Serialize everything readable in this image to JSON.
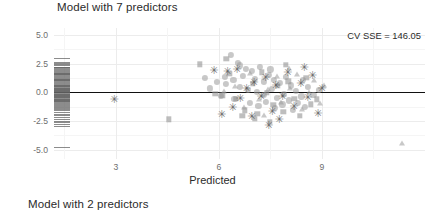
{
  "panels": {
    "top_title": "Model with 7 predictors",
    "bottom_title": "Model with 2 predictors"
  },
  "annotation": "CV SSE = 146.05",
  "chart_data": {
    "type": "scatter",
    "title": "Model with 7 predictors",
    "xlabel": "Predicted",
    "ylabel": "Prediction error\n(residual)",
    "xlim": [
      1.2,
      12.0
    ],
    "ylim": [
      -5.8,
      5.6
    ],
    "xticks": [
      "3",
      "6",
      "9"
    ],
    "xtick_values": [
      3,
      6,
      9
    ],
    "yticks": [
      "5.0",
      "2.5",
      "0.0",
      "-2.5",
      "-5.0"
    ],
    "ytick_values": [
      5.0,
      2.5,
      0.0,
      -2.5,
      -5.0
    ],
    "grid": true,
    "legend": "none",
    "annotations": [
      {
        "text": "CV SSE = 146.05",
        "x": 9.6,
        "y": 4.3
      }
    ],
    "reference_line": {
      "y": 0,
      "color": "#111111"
    },
    "marker_color": "#8f8f8f",
    "series": [
      {
        "name": "circle",
        "marker": "circle",
        "points": [
          [
            6.35,
            3.25
          ],
          [
            6.55,
            2.55
          ],
          [
            6.62,
            2.35
          ],
          [
            6.78,
            2.05
          ],
          [
            6.95,
            1.85
          ],
          [
            6.18,
            1.35
          ],
          [
            6.42,
            1.1
          ],
          [
            6.7,
            1.45
          ],
          [
            7.05,
            1.2
          ],
          [
            7.3,
            0.95
          ],
          [
            7.45,
            1.55
          ],
          [
            7.6,
            1.1
          ],
          [
            7.78,
            0.8
          ],
          [
            7.95,
            1.35
          ],
          [
            8.1,
            0.6
          ],
          [
            6.6,
            0.45
          ],
          [
            6.85,
            0.2
          ],
          [
            7.1,
            0.05
          ],
          [
            7.32,
            -0.2
          ],
          [
            7.55,
            0.3
          ],
          [
            7.7,
            -0.45
          ],
          [
            7.9,
            -0.1
          ],
          [
            8.05,
            -0.7
          ],
          [
            8.25,
            0.15
          ],
          [
            8.4,
            -0.35
          ],
          [
            6.9,
            -0.95
          ],
          [
            7.15,
            -1.15
          ],
          [
            7.38,
            -0.8
          ],
          [
            7.62,
            -1.35
          ],
          [
            7.85,
            -1.05
          ],
          [
            8.15,
            -1.5
          ],
          [
            8.3,
            -0.9
          ],
          [
            8.5,
            -1.25
          ],
          [
            6.45,
            -0.6
          ],
          [
            6.2,
            0.7
          ],
          [
            8.6,
            0.45
          ],
          [
            8.75,
            -0.2
          ],
          [
            5.95,
            0.9
          ],
          [
            5.75,
            0.35
          ],
          [
            8.9,
            0.2
          ],
          [
            7.2,
            2.25
          ],
          [
            7.5,
            2.0
          ],
          [
            6.05,
            -0.3
          ],
          [
            8.45,
            1.05
          ],
          [
            5.6,
            1.25
          ]
        ]
      },
      {
        "name": "square",
        "marker": "square",
        "points": [
          [
            4.55,
            -2.35
          ],
          [
            5.45,
            2.45
          ],
          [
            5.9,
            -0.15
          ],
          [
            6.1,
            -0.25
          ],
          [
            6.3,
            1.6
          ],
          [
            6.5,
            -0.55
          ],
          [
            6.75,
            -1.55
          ],
          [
            6.98,
            0.75
          ],
          [
            7.12,
            -1.85
          ],
          [
            7.25,
            1.75
          ],
          [
            7.4,
            -0.05
          ],
          [
            7.58,
            -1.1
          ],
          [
            7.72,
            0.55
          ],
          [
            7.88,
            -1.7
          ],
          [
            8.02,
            0.95
          ],
          [
            8.2,
            -0.55
          ],
          [
            8.35,
            -2.05
          ],
          [
            8.55,
            1.25
          ],
          [
            8.68,
            -1.05
          ],
          [
            6.22,
            2.9
          ],
          [
            7.05,
            -2.3
          ],
          [
            7.95,
            2.4
          ],
          [
            8.85,
            -0.6
          ],
          [
            6.68,
            -2.05
          ],
          [
            7.48,
            -2.55
          ]
        ]
      },
      {
        "name": "triangle",
        "marker": "triangle",
        "points": [
          [
            6.48,
            0.55
          ],
          [
            6.9,
            1.65
          ],
          [
            7.18,
            -0.55
          ],
          [
            7.42,
            0.25
          ],
          [
            7.68,
            1.45
          ],
          [
            7.82,
            -0.85
          ],
          [
            8.08,
            0.35
          ],
          [
            8.28,
            1.6
          ],
          [
            8.42,
            -1.45
          ],
          [
            8.62,
            0.05
          ],
          [
            8.78,
            1.1
          ],
          [
            6.72,
            -1.25
          ],
          [
            7.3,
            -1.95
          ],
          [
            8.95,
            -0.95
          ],
          [
            9.05,
            0.65
          ],
          [
            11.32,
            -4.45
          ],
          [
            8.05,
            2.1
          ],
          [
            6.15,
            0.1
          ]
        ]
      },
      {
        "name": "asterisk",
        "marker": "asterisk",
        "points": [
          [
            2.95,
            -0.55
          ],
          [
            5.85,
            1.95
          ],
          [
            6.25,
            1.9
          ],
          [
            6.52,
            2.05
          ],
          [
            6.8,
            0.35
          ],
          [
            6.62,
            -0.45
          ],
          [
            6.4,
            -1.25
          ],
          [
            6.95,
            -2.1
          ],
          [
            7.02,
            0.9
          ],
          [
            7.22,
            -0.35
          ],
          [
            7.35,
            1.35
          ],
          [
            7.55,
            -1.6
          ],
          [
            7.65,
            0.65
          ],
          [
            7.85,
            -0.35
          ],
          [
            8.0,
            1.8
          ],
          [
            8.18,
            -1.15
          ],
          [
            8.38,
            0.85
          ],
          [
            8.58,
            -0.4
          ],
          [
            8.72,
            1.5
          ],
          [
            8.88,
            -1.8
          ],
          [
            6.08,
            -1.85
          ],
          [
            7.45,
            -2.85
          ],
          [
            8.48,
            2.25
          ],
          [
            7.75,
            -2.35
          ],
          [
            9.0,
            0.4
          ]
        ]
      }
    ],
    "rug": {
      "axis": "y",
      "side": "left",
      "values": [
        3.0,
        2.65,
        2.55,
        2.45,
        2.35,
        2.25,
        2.18,
        2.1,
        2.02,
        1.95,
        1.88,
        1.8,
        1.72,
        1.65,
        1.58,
        1.5,
        1.42,
        1.35,
        1.28,
        1.2,
        1.12,
        1.05,
        0.98,
        0.9,
        0.82,
        0.75,
        0.68,
        0.6,
        0.55,
        0.48,
        0.42,
        0.35,
        0.3,
        0.25,
        0.2,
        0.15,
        0.1,
        0.05,
        0.0,
        -0.05,
        -0.1,
        -0.15,
        -0.2,
        -0.25,
        -0.3,
        -0.35,
        -0.42,
        -0.48,
        -0.55,
        -0.62,
        -0.7,
        -0.78,
        -0.85,
        -0.95,
        -1.05,
        -1.15,
        -1.28,
        -1.4,
        -1.55,
        -1.7,
        -1.85,
        -2.0,
        -2.15,
        -2.3,
        -2.45,
        -2.6,
        -2.75,
        -2.9,
        -4.75
      ]
    }
  }
}
